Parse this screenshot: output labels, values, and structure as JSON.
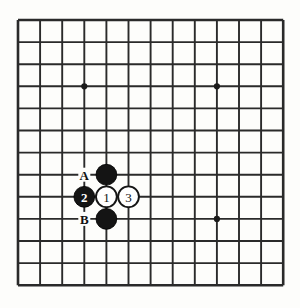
{
  "diagram": {
    "board": {
      "type": "go-board",
      "grid_columns": 13,
      "grid_rows": 13,
      "line_color": "#2a2a2a",
      "background_color": "#fdfdfb",
      "origin_x": 18,
      "origin_y": 20,
      "spacing": 22.1
    },
    "star_points": [
      {
        "name": "star-point-upper-left",
        "col": 3,
        "row": 3
      },
      {
        "name": "star-point-upper-right",
        "col": 9,
        "row": 3
      },
      {
        "name": "star-point-lower-right",
        "col": 9,
        "row": 9
      }
    ],
    "stones": [
      {
        "name": "black-stone-upper",
        "color": "black",
        "col": 4,
        "row": 7,
        "number": ""
      },
      {
        "name": "black-stone-move-2",
        "color": "black",
        "col": 3,
        "row": 8,
        "number": "2"
      },
      {
        "name": "white-stone-move-1",
        "color": "white",
        "col": 4,
        "row": 8,
        "number": "1"
      },
      {
        "name": "white-stone-move-3",
        "color": "white",
        "col": 5,
        "row": 8,
        "number": "3"
      },
      {
        "name": "black-stone-lower",
        "color": "black",
        "col": 4,
        "row": 9,
        "number": ""
      }
    ],
    "point_labels": [
      {
        "name": "point-label-a",
        "text": "A",
        "col": 3,
        "row": 7
      },
      {
        "name": "point-label-b",
        "text": "B",
        "col": 3,
        "row": 9
      }
    ],
    "colors": {
      "black_stone": "#141414",
      "white_stone": "#ffffff",
      "stone_outline": "#151515",
      "grid": "#2a2a2a",
      "label_text": "#111111"
    }
  }
}
